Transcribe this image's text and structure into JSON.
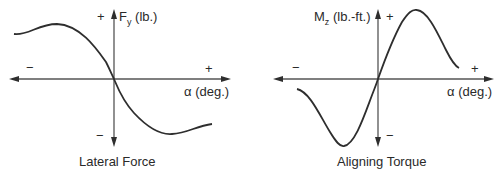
{
  "panels": [
    {
      "title": "Lateral Force",
      "y_axis_label": "F",
      "y_axis_sub": "y",
      "y_axis_unit": " (lb.)",
      "x_axis_label": "α (deg.)",
      "plus_y": "+",
      "minus_y": "−",
      "plus_x": "+",
      "minus_x": "−"
    },
    {
      "title": "Aligning Torque",
      "y_axis_label": "M",
      "y_axis_sub": "z",
      "y_axis_unit": " (lb.-ft.)",
      "x_axis_label": "α (deg.)",
      "plus_y": "+",
      "minus_y": "−",
      "plus_x": "+",
      "minus_x": "−"
    }
  ],
  "colors": {
    "axis": "#555555",
    "curve": "#2e2e2e",
    "text": "#2a2a2a",
    "background": "#ffffff"
  }
}
